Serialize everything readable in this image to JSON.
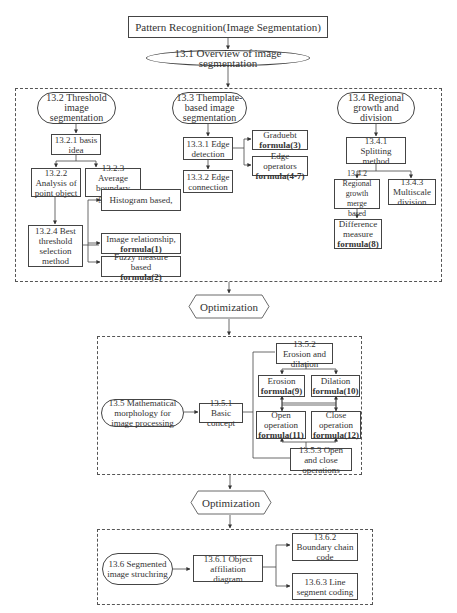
{
  "title": "Pattern Recognition(Image Segmentation)",
  "overview": "13.1 Overview of image segmentation",
  "section1": {
    "threshold": {
      "title": "13.2 Threshold image segmentation",
      "basis": "13.2.1 basis idea",
      "point": "13.2.2 Analysis of point object",
      "gradient": "13.2.3 Average boundary gradient",
      "best": "13.2.4 Best threshold selection method",
      "histogram": "Histogram based,",
      "relationship": "Image relationship,",
      "relationship_formula": "formula(1)",
      "fuzzy": "Fuzzy measure based",
      "fuzzy_formula": "formula(2)"
    },
    "template": {
      "title": "13.3 Themplate-based image segmentation",
      "edge_detection": "13.3.1 Edge detection",
      "edge_connection": "13.3.2 Edge connection",
      "graduebt": "Graduebt",
      "graduebt_formula": "formula(3)",
      "operators": "Edge operators",
      "operators_formula": "formula(4-7)"
    },
    "regional": {
      "title": "13.4 Regional growth and division",
      "splitting": "13.4.1 Splitting method",
      "merge": "13.4.2 Regional growth merge based",
      "multiscale": "13.4.3 Multiscale division",
      "difference": "Difference measure",
      "difference_formula": "formula(8)"
    }
  },
  "optimization1": "Optimization",
  "section2": {
    "morphology": "13.5 Mathematical morphology for image processing",
    "basic": "13.5.1 Basic concept",
    "erosion_dilation": "13.5.2 Erosion and dilation",
    "erosion": "Erosion",
    "erosion_formula": "formula(9)",
    "dilation": "Dilation",
    "dilation_formula": "formula(10)",
    "open": "Open operation",
    "open_formula": "formula(11)",
    "close": "Close operation",
    "close_formula": "formula(12)",
    "open_close": "13.5.3 Open and close operations"
  },
  "optimization2": "Optimization",
  "section3": {
    "structuring": "13.6 Segmented image struchring",
    "affiliation": "13.6.1 Object affiliation diagram",
    "boundary": "13.6.2 Boundary chain code",
    "line": "13.6.3 Line segment coding"
  }
}
